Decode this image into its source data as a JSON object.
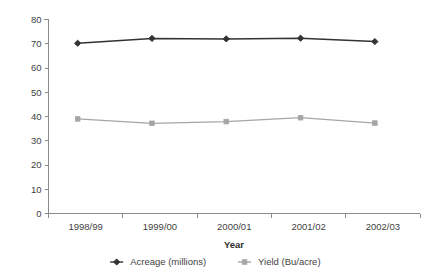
{
  "chart_data": {
    "type": "line",
    "title": "",
    "xlabel": "Year",
    "ylabel": "",
    "categories": [
      "1998/99",
      "1999/00",
      "2000/01",
      "2001/02",
      "2002/03"
    ],
    "series": [
      {
        "name": "Acreage (millions)",
        "values": [
          70.2,
          72.2,
          72.0,
          72.3,
          70.9
        ],
        "color": "#333333",
        "marker": "diamond"
      },
      {
        "name": "Yield (Bu/acre)",
        "values": [
          39.0,
          37.2,
          37.9,
          39.5,
          37.3
        ],
        "color": "#a6a6a6",
        "marker": "square"
      }
    ],
    "ylim": [
      0,
      80
    ],
    "ytick_step": 10,
    "ytick_labels": [
      "0",
      "10",
      "20",
      "30",
      "40",
      "50",
      "60",
      "70",
      "80"
    ],
    "grid": false,
    "legend_position": "bottom"
  },
  "legend": {
    "items": [
      {
        "label": "Acreage (millions)",
        "color": "#333333"
      },
      {
        "label": "Yield (Bu/acre)",
        "color": "#a6a6a6"
      }
    ]
  },
  "axes": {
    "x_title": "Year"
  }
}
